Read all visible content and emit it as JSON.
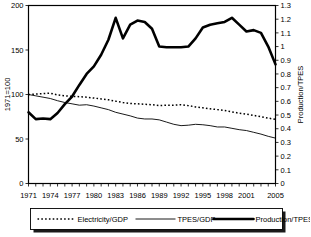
{
  "chart_data": {
    "type": "line",
    "title": "",
    "xlabel": "",
    "ylabel": "1971=100",
    "y2label": "Production/TPES",
    "ylim": [
      0,
      200
    ],
    "y2lim": [
      0,
      1.3
    ],
    "xlim": [
      1971,
      2005
    ],
    "grid": false,
    "legend_position": "bottom",
    "yticks": [
      0,
      50,
      100,
      150,
      200
    ],
    "ytick_labels": [
      "0",
      "50",
      "100",
      "150",
      "200"
    ],
    "y2ticks": [
      0,
      0.1,
      0.2,
      0.3,
      0.4,
      0.5,
      0.6,
      0.7,
      0.8,
      0.9,
      1,
      1.1,
      1.2,
      1.3
    ],
    "y2tick_labels": [
      "0",
      "0.1",
      "0.2",
      "0.3",
      "0.4",
      "0.5",
      "0.6",
      "0.7",
      "0.8",
      "0.9",
      "1",
      "1.1",
      "1.2",
      "1.3"
    ],
    "x": [
      1971,
      1972,
      1973,
      1974,
      1975,
      1976,
      1977,
      1978,
      1979,
      1980,
      1981,
      1982,
      1983,
      1984,
      1985,
      1986,
      1987,
      1988,
      1989,
      1990,
      1991,
      1992,
      1993,
      1994,
      1995,
      1996,
      1997,
      1998,
      1999,
      2000,
      2001,
      2002,
      2003,
      2004,
      2005
    ],
    "xtick_labels": [
      "1971",
      "1974",
      "1977",
      "1980",
      "1983",
      "1986",
      "1989",
      "1992",
      "1995",
      "1998",
      "2001",
      "2005"
    ],
    "xtick_values": [
      1971,
      1974,
      1977,
      1980,
      1983,
      1986,
      1989,
      1992,
      1995,
      1998,
      2001,
      2005
    ],
    "series": [
      {
        "name": "Electricity/GDP",
        "axis": "left",
        "style": "dotted",
        "values": [
          100,
          100.5,
          101,
          101.5,
          99.5,
          98.5,
          98,
          97.5,
          97,
          96,
          95,
          94,
          92.5,
          91,
          90,
          89.5,
          89,
          88.5,
          87.5,
          88,
          88,
          88.5,
          87.5,
          86,
          85,
          84,
          83,
          82,
          80.5,
          79,
          78,
          76.5,
          75,
          73.5,
          72
        ]
      },
      {
        "name": "TPES/GDP",
        "axis": "left",
        "style": "thin",
        "values": [
          100,
          98.5,
          97,
          95.5,
          93,
          91,
          89.5,
          88,
          88.5,
          87,
          85,
          83,
          80,
          78,
          76,
          73.5,
          72.5,
          72.5,
          71.5,
          69,
          66.5,
          65,
          65.5,
          66.5,
          66,
          65,
          63.5,
          63.5,
          62,
          60.5,
          59.5,
          57.5,
          55.5,
          53,
          51
        ]
      },
      {
        "name": "Production/TPES",
        "axis": "right",
        "style": "thick",
        "values": [
          0.52,
          0.47,
          0.475,
          0.47,
          0.515,
          0.58,
          0.635,
          0.72,
          0.8,
          0.855,
          0.94,
          1.05,
          1.21,
          1.06,
          1.16,
          1.19,
          1.18,
          1.13,
          1.0,
          0.995,
          0.995,
          0.995,
          1.0,
          1.06,
          1.14,
          1.16,
          1.17,
          1.18,
          1.21,
          1.16,
          1.11,
          1.12,
          1.1,
          1.0,
          0.87
        ]
      }
    ]
  },
  "legend": {
    "items": [
      {
        "label": "Electricity/GDP",
        "style": "dotted"
      },
      {
        "label": "TPES/GDP",
        "style": "thin"
      },
      {
        "label": "Production/TPES",
        "style": "thick"
      }
    ]
  }
}
